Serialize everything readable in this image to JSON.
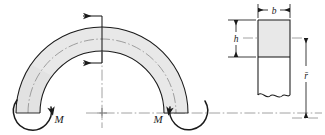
{
  "figure": {
    "type": "engineering-diagram",
    "background_color": "#ffffff",
    "line_color": "#1a1a1a",
    "fill_color": "#e8e8e8",
    "centerline_color": "#7a7a7a"
  },
  "labels": {
    "moment_left": "M",
    "moment_right": "M",
    "width": "b",
    "height": "h",
    "radius_mean": "r̄"
  },
  "curved_beam": {
    "name": "curved-beam-body",
    "center": {
      "x": 102,
      "y": 113
    },
    "outer_radius": 86,
    "inner_radius": 62,
    "centroidal_radius": 74,
    "start_angle_deg": 180,
    "end_angle_deg": 0,
    "fill": "#e8e8e8",
    "stroke": "#1a1a1a"
  },
  "cut_section": {
    "name": "cut-plane-at-apex",
    "x": 102,
    "top_y": 27,
    "bottom_y": 51
  },
  "shear_arrows": [
    {
      "name": "top-arrow",
      "direction": "left",
      "x_tail": 102,
      "x_head": 81,
      "y": 16
    },
    {
      "name": "bottom-arrow",
      "direction": "left",
      "x_tail": 102,
      "x_head": 81,
      "y": 63
    }
  ],
  "moment_arcs": [
    {
      "name": "left-moment-arc",
      "center_x": 35,
      "center_y": 112,
      "radius": 18,
      "arrowhead": "upper-right"
    },
    {
      "name": "right-moment-arc",
      "center_x": 186,
      "center_y": 112,
      "radius": 18,
      "arrowhead": "upper-left"
    }
  ],
  "center_mark": {
    "name": "arc-center-plus-mark",
    "x": 102,
    "y": 113
  },
  "cross_section": {
    "name": "rectangular-cross-section",
    "left": 258,
    "right": 290,
    "top": 20,
    "solid_bottom": 57,
    "break_y": 97,
    "fill": "#e8e8e8",
    "stroke": "#1a1a1a",
    "has_break_line": true,
    "neutral_axis_y": 38
  },
  "dimensions": {
    "b": {
      "name": "width-dimension",
      "orientation": "horizontal",
      "y": 10,
      "from_x": 258,
      "to_x": 290
    },
    "h": {
      "name": "height-dimension",
      "orientation": "vertical",
      "x": 236,
      "from_y": 20,
      "to_y": 57
    },
    "r_bar": {
      "name": "mean-radius-dimension",
      "orientation": "vertical",
      "x": 306,
      "from_y": 38,
      "to_y": 118
    }
  },
  "centerlines": {
    "horizontal": {
      "name": "horizontal-centerline",
      "y": 113,
      "from_x": 86,
      "to_x": 322
    },
    "vertical": {
      "name": "vertical-centerline",
      "x": 102,
      "from_y": 12,
      "to_y": 128
    },
    "section_axis": {
      "name": "section-neutral-axis-line",
      "y": 38,
      "from_x": 243,
      "to_x": 302
    }
  }
}
